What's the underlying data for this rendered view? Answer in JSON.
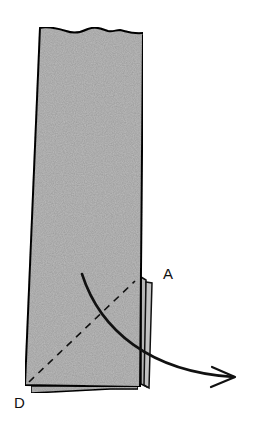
{
  "diagram": {
    "type": "paper-folding-illustration",
    "labels": {
      "corner_a": "A",
      "corner_d": "D"
    },
    "colors": {
      "paper_fill": "#bdbdbd",
      "paper_fill_dark": "#a9a9a9",
      "outline": "#111111",
      "background": "#ffffff"
    },
    "elements": {
      "paper_strip": "tall paper strip with wavy torn top edge",
      "fold_line": "dashed diagonal from corner D up to corner A",
      "fold_arrow": "curved arrow indicating fold direction toward the right",
      "side_flaps": "folded layers visible along lower right edge"
    }
  }
}
